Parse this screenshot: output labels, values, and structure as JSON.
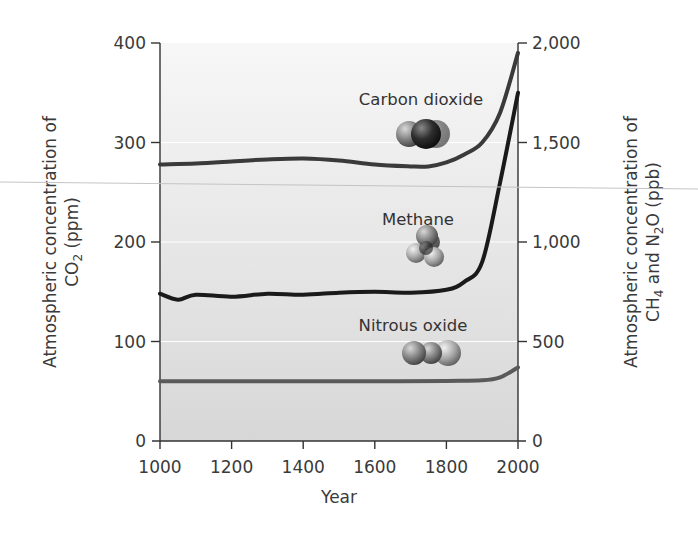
{
  "chart_data": {
    "type": "line",
    "title": "",
    "xlabel": "Year",
    "ylabel_left": "Atmospheric concentration of CO2 (ppm)",
    "ylabel_right": "Atmospheric concentration of CH4 and N2O (ppb)",
    "xlim": [
      1000,
      2000
    ],
    "ylim_left": [
      0,
      400
    ],
    "ylim_right": [
      0,
      2000
    ],
    "x_ticks": [
      "1000",
      "1200",
      "1400",
      "1600",
      "1800",
      "2000"
    ],
    "y_left_ticks": [
      "0",
      "100",
      "200",
      "300",
      "400"
    ],
    "y_right_ticks": [
      "0",
      "500",
      "1,000",
      "1,500",
      "2,000"
    ],
    "grid": "horizontal white lines at major ticks",
    "series": [
      {
        "name": "Carbon dioxide",
        "axis": "left",
        "unit": "ppm",
        "color": "#3a3a3a",
        "x": [
          1000,
          1100,
          1200,
          1300,
          1400,
          1500,
          1600,
          1700,
          1750,
          1800,
          1850,
          1900,
          1950,
          2000
        ],
        "values": [
          278,
          279,
          281,
          283,
          284,
          282,
          278,
          276,
          276,
          280,
          288,
          300,
          330,
          390
        ]
      },
      {
        "name": "Methane",
        "axis": "right",
        "unit": "ppb",
        "color": "#1a1a1a",
        "x": [
          1000,
          1050,
          1100,
          1200,
          1300,
          1400,
          1500,
          1600,
          1700,
          1800,
          1850,
          1900,
          1950,
          2000
        ],
        "values": [
          740,
          710,
          735,
          725,
          740,
          735,
          745,
          750,
          745,
          760,
          800,
          900,
          1300,
          1750
        ]
      },
      {
        "name": "Nitrous oxide",
        "axis": "right",
        "unit": "ppb",
        "color": "#5a5a5a",
        "x": [
          1000,
          1200,
          1400,
          1600,
          1800,
          1900,
          1950,
          2000
        ],
        "values": [
          300,
          300,
          300,
          300,
          302,
          305,
          320,
          370
        ]
      }
    ],
    "annotations": [
      "Carbon dioxide",
      "Methane",
      "Nitrous oxide"
    ],
    "legend": "inline labels with molecule illustrations"
  },
  "labels": {
    "xlabel": "Year",
    "ylabel_left_line1": "Atmospheric concentration of",
    "ylabel_left_line2_pre": "CO",
    "ylabel_left_line2_sub": "2",
    "ylabel_left_line2_post": " (ppm)",
    "ylabel_right_line1": "Atmospheric concentration of",
    "ylabel_right_line2_a": "CH",
    "ylabel_right_line2_sub1": "4",
    "ylabel_right_line2_b": " and N",
    "ylabel_right_line2_sub2": "2",
    "ylabel_right_line2_c": "O (ppb)",
    "co2": "Carbon dioxide",
    "ch4": "Methane",
    "n2o": "Nitrous oxide"
  },
  "colors": {
    "plot_bg_top": "#f7f7f7",
    "plot_bg_bottom": "#d9d9d9",
    "axis": "#333333",
    "grid": "#ffffff"
  }
}
